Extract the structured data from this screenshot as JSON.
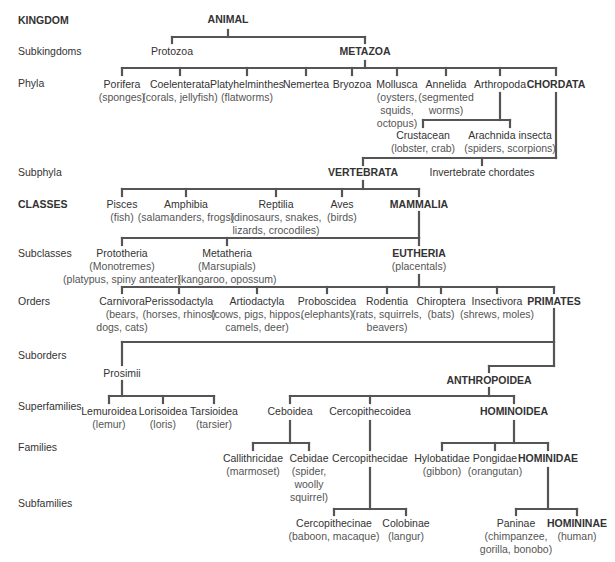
{
  "colors": {
    "line": "#555555",
    "text": "#333333",
    "subtext": "#666666",
    "background": "#ffffff"
  },
  "ranks": [
    {
      "label": "KINGDOM",
      "bold": true,
      "y": 14
    },
    {
      "label": "Subkingdoms",
      "bold": false,
      "y": 45
    },
    {
      "label": "Phyla",
      "bold": false,
      "y": 77
    },
    {
      "label": "Subphyla",
      "bold": false,
      "y": 166
    },
    {
      "label": "CLASSES",
      "bold": true,
      "y": 198
    },
    {
      "label": "Subclasses",
      "bold": false,
      "y": 247
    },
    {
      "label": "Orders",
      "bold": false,
      "y": 295
    },
    {
      "label": "Suborders",
      "bold": false,
      "y": 349
    },
    {
      "label": "Superfamilies",
      "bold": false,
      "y": 400
    },
    {
      "label": "Families",
      "bold": false,
      "y": 441
    },
    {
      "label": "Subfamilies",
      "bold": false,
      "y": 497
    }
  ],
  "nodes": {
    "animal": {
      "name": "ANIMAL",
      "bold": true,
      "x": 228,
      "y": 13
    },
    "protozoa": {
      "name": "Protozoa",
      "x": 172,
      "y": 45
    },
    "metazoa": {
      "name": "METAZOA",
      "bold": true,
      "x": 365,
      "y": 45
    },
    "porifera": {
      "name": "Porifera",
      "sub": "(sponges)",
      "x": 122,
      "y": 78
    },
    "coelenterata": {
      "name": "Coelenterata",
      "sub": "(corals, jellyfish)",
      "x": 180,
      "y": 78
    },
    "platyhelminthes": {
      "name": "Platyhelminthes",
      "sub": "(flatworms)",
      "x": 247,
      "y": 78
    },
    "nemertea": {
      "name": "Nemertea",
      "x": 306,
      "y": 78
    },
    "bryozoa": {
      "name": "Bryozoa",
      "x": 352,
      "y": 78
    },
    "mollusca": {
      "name": "Mollusca",
      "sub": "(oysters,\nsquids,\noctopus)",
      "x": 397,
      "y": 78
    },
    "annelida": {
      "name": "Annelida",
      "sub": "(segmented\nworms)",
      "x": 446,
      "y": 78
    },
    "arthropoda": {
      "name": "Arthropoda",
      "x": 500,
      "y": 78
    },
    "chordata": {
      "name": "CHORDATA",
      "bold": true,
      "x": 556,
      "y": 78
    },
    "crustacean": {
      "name": "Crustacean",
      "sub": "(lobster, crab)",
      "x": 423,
      "y": 129
    },
    "arachnida": {
      "name": "Arachnida insecta",
      "sub": "(spiders, scorpions)",
      "x": 510,
      "y": 129
    },
    "vertebrata": {
      "name": "VERTEBRATA",
      "bold": true,
      "x": 363,
      "y": 166
    },
    "invertebrate": {
      "name": "Invertebrate chordates",
      "x": 482,
      "y": 166
    },
    "pisces": {
      "name": "Pisces",
      "sub": "(fish)",
      "x": 122,
      "y": 198
    },
    "amphibia": {
      "name": "Amphibia",
      "sub": "(salamanders, frogs)",
      "x": 186,
      "y": 198
    },
    "reptilia": {
      "name": "Reptilia",
      "sub": "(dinosaurs, snakes,\nlizards, crocodiles)",
      "x": 276,
      "y": 198
    },
    "aves": {
      "name": "Aves",
      "sub": "(birds)",
      "x": 342,
      "y": 198
    },
    "mammalia": {
      "name": "MAMMALIA",
      "bold": true,
      "x": 419,
      "y": 198
    },
    "prototheria": {
      "name": "Prototheria",
      "sub": "(Monotremes)\n(platypus, spiny anteater)",
      "x": 122,
      "y": 247
    },
    "metatheria": {
      "name": "Metatheria",
      "sub": "(Marsupials)\n(kangaroo, opossum)",
      "x": 227,
      "y": 247
    },
    "eutheria": {
      "name": "EUTHERIA",
      "bold": true,
      "sub": "(placentals)",
      "x": 419,
      "y": 247
    },
    "carnivora": {
      "name": "Carnivora",
      "sub": "(bears,\ndogs, cats)",
      "x": 122,
      "y": 295
    },
    "perissodactyla": {
      "name": "Perissodactyla",
      "sub": "(horses, rhinos)",
      "x": 179,
      "y": 295
    },
    "artiodactyla": {
      "name": "Artiodactyla",
      "sub": "(cows, pigs, hippos,\ncamels, deer)",
      "x": 257,
      "y": 295
    },
    "proboscidea": {
      "name": "Proboscidea",
      "sub": "(elephants)",
      "x": 327,
      "y": 295
    },
    "rodentia": {
      "name": "Rodentia",
      "sub": "(rats, squirrels,\nbeavers)",
      "x": 387,
      "y": 295
    },
    "chiroptera": {
      "name": "Chiroptera",
      "sub": "(bats)",
      "x": 441,
      "y": 295
    },
    "insectivora": {
      "name": "Insectivora",
      "sub": "(shrews, moles)",
      "x": 497,
      "y": 295
    },
    "primates": {
      "name": "PRIMATES",
      "bold": true,
      "x": 554,
      "y": 295
    },
    "prosimii": {
      "name": "Prosimii",
      "x": 122,
      "y": 367
    },
    "anthropoidea": {
      "name": "ANTHROPOIDEA",
      "bold": true,
      "x": 489,
      "y": 374
    },
    "lemuroidea": {
      "name": "Lemuroidea",
      "sub": "(lemur)",
      "x": 109,
      "y": 405
    },
    "lorisoidea": {
      "name": "Lorisoidea",
      "sub": "(loris)",
      "x": 163,
      "y": 405
    },
    "tarsioidea": {
      "name": "Tarsioidea",
      "sub": "(tarsier)",
      "x": 214,
      "y": 405
    },
    "ceboidea": {
      "name": "Ceboidea",
      "x": 290,
      "y": 405
    },
    "cercopithecoidea": {
      "name": "Cercopithecoidea",
      "x": 370,
      "y": 405
    },
    "hominoidea": {
      "name": "HOMINOIDEA",
      "bold": true,
      "x": 514,
      "y": 405
    },
    "callithricidae": {
      "name": "Callithricidae",
      "sub": "(marmoset)",
      "x": 253,
      "y": 452
    },
    "cebidae": {
      "name": "Cebidae",
      "sub": "(spider,\nwoolly\nsquirrel)",
      "x": 309,
      "y": 452
    },
    "cercopithecidae": {
      "name": "Cercopithecidae",
      "x": 370,
      "y": 452
    },
    "hylobatidae": {
      "name": "Hylobatidae",
      "sub": "(gibbon)",
      "x": 442,
      "y": 452
    },
    "pongidae": {
      "name": "Pongidae",
      "sub": "(orangutan)",
      "x": 495,
      "y": 452
    },
    "hominidae": {
      "name": "HOMINIDAE",
      "bold": true,
      "x": 548,
      "y": 452
    },
    "cercopithecinae": {
      "name": "Cercopithecinae",
      "sub": "(baboon, macaque)",
      "x": 334,
      "y": 517
    },
    "colobinae": {
      "name": "Colobinae",
      "sub": "(langur)",
      "x": 406,
      "y": 517
    },
    "paninae": {
      "name": "Paninae",
      "sub": "(chimpanzee,\ngorilla, bonobo)",
      "x": 516,
      "y": 517
    },
    "homininae": {
      "name": "HOMININAE",
      "bold": true,
      "sub": "(human)",
      "x": 577,
      "y": 517
    }
  }
}
